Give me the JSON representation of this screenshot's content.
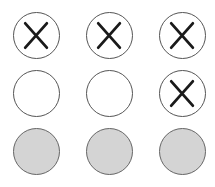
{
  "board": {
    "rows": 3,
    "cols": 3,
    "cells": [
      {
        "row": 0,
        "col": 0,
        "state": "x",
        "icon": "x-mark-icon"
      },
      {
        "row": 0,
        "col": 1,
        "state": "x",
        "icon": "x-mark-icon"
      },
      {
        "row": 0,
        "col": 2,
        "state": "x",
        "icon": "x-mark-icon"
      },
      {
        "row": 1,
        "col": 0,
        "state": "empty"
      },
      {
        "row": 1,
        "col": 1,
        "state": "empty"
      },
      {
        "row": 1,
        "col": 2,
        "state": "x",
        "icon": "x-mark-icon"
      },
      {
        "row": 2,
        "col": 0,
        "state": "filled"
      },
      {
        "row": 2,
        "col": 1,
        "state": "filled"
      },
      {
        "row": 2,
        "col": 2,
        "state": "filled"
      }
    ],
    "colors": {
      "fill": "#d4d4d4",
      "stroke": "#555555",
      "mark": "#1a1a1a"
    }
  }
}
